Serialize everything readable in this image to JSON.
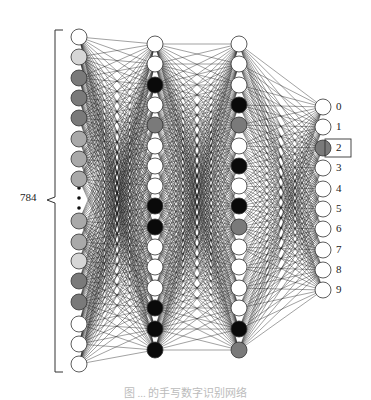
{
  "diagram": {
    "type": "neural-network",
    "input_label": "784",
    "caption": "图 ... 的手写数字识别网络",
    "highlight_output": "2",
    "colors": {
      "white": "#ffffff",
      "light": "#d6d6d6",
      "mid": "#a9a9a9",
      "dark": "#7a7a7a",
      "black": "#0a0a0a",
      "edge": "#1a1a1a"
    },
    "layers": [
      {
        "name": "input",
        "x": 79,
        "nodes": [
          {
            "y": 37,
            "fill": "white"
          },
          {
            "y": 57,
            "fill": "light"
          },
          {
            "y": 78,
            "fill": "dark"
          },
          {
            "y": 98,
            "fill": "dark"
          },
          {
            "y": 118,
            "fill": "dark"
          },
          {
            "y": 139,
            "fill": "mid"
          },
          {
            "y": 159,
            "fill": "mid"
          },
          {
            "y": 179,
            "fill": "mid"
          },
          {
            "y": 221,
            "fill": "mid"
          },
          {
            "y": 242,
            "fill": "mid"
          },
          {
            "y": 261,
            "fill": "light"
          },
          {
            "y": 281,
            "fill": "dark"
          },
          {
            "y": 302,
            "fill": "dark"
          },
          {
            "y": 324,
            "fill": "white"
          },
          {
            "y": 344,
            "fill": "white"
          },
          {
            "y": 364,
            "fill": "white"
          }
        ],
        "ellipsis_dots_y": [
          188,
          198,
          208
        ]
      },
      {
        "name": "hidden-1",
        "x": 155,
        "nodes": [
          {
            "y": 44,
            "fill": "white"
          },
          {
            "y": 64,
            "fill": "white"
          },
          {
            "y": 85,
            "fill": "black"
          },
          {
            "y": 105,
            "fill": "white"
          },
          {
            "y": 125,
            "fill": "dark"
          },
          {
            "y": 146,
            "fill": "white"
          },
          {
            "y": 166,
            "fill": "white"
          },
          {
            "y": 186,
            "fill": "white"
          },
          {
            "y": 206,
            "fill": "black"
          },
          {
            "y": 227,
            "fill": "black"
          },
          {
            "y": 247,
            "fill": "white"
          },
          {
            "y": 267,
            "fill": "white"
          },
          {
            "y": 288,
            "fill": "white"
          },
          {
            "y": 308,
            "fill": "black"
          },
          {
            "y": 329,
            "fill": "black"
          },
          {
            "y": 350,
            "fill": "black"
          }
        ]
      },
      {
        "name": "hidden-2",
        "x": 239,
        "nodes": [
          {
            "y": 44,
            "fill": "white"
          },
          {
            "y": 64,
            "fill": "white"
          },
          {
            "y": 85,
            "fill": "white"
          },
          {
            "y": 105,
            "fill": "black"
          },
          {
            "y": 125,
            "fill": "dark"
          },
          {
            "y": 146,
            "fill": "white"
          },
          {
            "y": 166,
            "fill": "black"
          },
          {
            "y": 186,
            "fill": "white"
          },
          {
            "y": 206,
            "fill": "black"
          },
          {
            "y": 227,
            "fill": "dark"
          },
          {
            "y": 247,
            "fill": "white"
          },
          {
            "y": 267,
            "fill": "white"
          },
          {
            "y": 288,
            "fill": "white"
          },
          {
            "y": 308,
            "fill": "white"
          },
          {
            "y": 329,
            "fill": "black"
          },
          {
            "y": 350,
            "fill": "dark"
          }
        ]
      },
      {
        "name": "output",
        "x": 323,
        "nodes": [
          {
            "y": 107,
            "fill": "white",
            "label": "0"
          },
          {
            "y": 127,
            "fill": "white",
            "label": "1"
          },
          {
            "y": 148,
            "fill": "dark",
            "label": "2"
          },
          {
            "y": 168,
            "fill": "white",
            "label": "3"
          },
          {
            "y": 189,
            "fill": "white",
            "label": "4"
          },
          {
            "y": 209,
            "fill": "white",
            "label": "5"
          },
          {
            "y": 229,
            "fill": "white",
            "label": "6"
          },
          {
            "y": 250,
            "fill": "white",
            "label": "7"
          },
          {
            "y": 270,
            "fill": "white",
            "label": "8"
          },
          {
            "y": 290,
            "fill": "white",
            "label": "9"
          }
        ]
      }
    ]
  }
}
